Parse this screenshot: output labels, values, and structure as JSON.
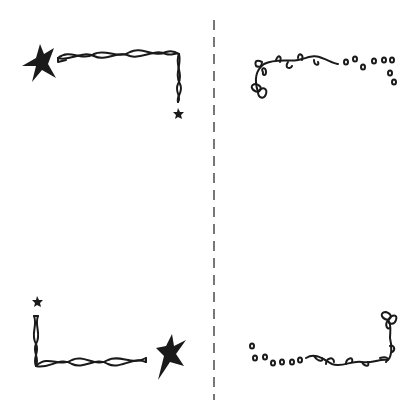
{
  "page": {
    "background": "#ffffff"
  },
  "divider": {
    "style": "dashed",
    "color": "#777777",
    "orientation": "vertical"
  },
  "panels": [
    {
      "position": "top-left",
      "motif": "twisted-rope with stars",
      "color": "#1a1a1a"
    },
    {
      "position": "top-right",
      "motif": "leafy vine with dots",
      "color": "#1a1a1a"
    },
    {
      "position": "bottom-left",
      "motif": "twisted-rope with stars",
      "color": "#1a1a1a"
    },
    {
      "position": "bottom-right",
      "motif": "leafy vine with dots",
      "color": "#1a1a1a"
    }
  ],
  "icons": [
    "star-icon",
    "small-star-icon",
    "rope-border-icon",
    "vine-border-icon",
    "leaf-icon",
    "dot-icon"
  ]
}
